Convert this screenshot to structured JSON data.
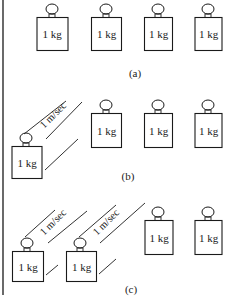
{
  "diagram": {
    "stroke_color": "#1a1a1a",
    "background": "#ffffff",
    "panels": [
      {
        "label": "(a)",
        "weights": [
          {
            "text": "1 kg",
            "moving": false
          },
          {
            "text": "1 kg",
            "moving": false
          },
          {
            "text": "1 kg",
            "moving": false
          },
          {
            "text": "1 kg",
            "moving": false
          }
        ]
      },
      {
        "label": "(b)",
        "weights": [
          {
            "text": "1 kg",
            "moving": true,
            "velocity": "1 m/sec"
          },
          {
            "text": "1 kg",
            "moving": false
          },
          {
            "text": "1 kg",
            "moving": false
          },
          {
            "text": "1 kg",
            "moving": false
          }
        ]
      },
      {
        "label": "(c)",
        "weights": [
          {
            "text": "1 kg",
            "moving": true,
            "velocity": "1 m/sec"
          },
          {
            "text": "1 kg",
            "moving": true,
            "velocity": "1 m/sec"
          },
          {
            "text": "1 kg",
            "moving": false
          },
          {
            "text": "1 kg",
            "moving": false
          }
        ]
      }
    ]
  }
}
